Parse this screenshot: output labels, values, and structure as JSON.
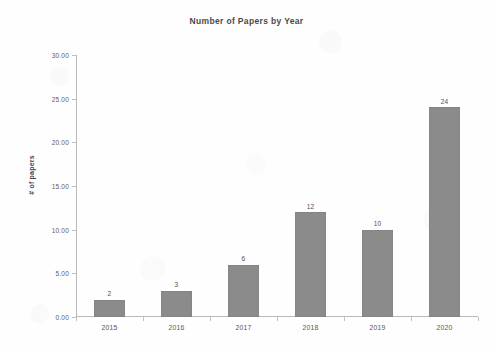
{
  "chart_data": {
    "type": "bar",
    "title": "Number of Papers by Year",
    "xlabel": "",
    "ylabel": "# of papers",
    "categories": [
      "2015",
      "2016",
      "2017",
      "2018",
      "2019",
      "2020"
    ],
    "values": [
      2,
      3,
      6,
      12,
      10,
      24
    ],
    "value_labels": [
      "2",
      "3",
      "6",
      "12",
      "10",
      "24"
    ],
    "ylim": [
      0,
      30
    ],
    "ytick_step": 5,
    "ytick_labels": [
      "0.00",
      "5.00",
      "10.00",
      "15.00",
      "20.00",
      "25.00",
      "30.00"
    ],
    "ytick_values": [
      0,
      5,
      10,
      15,
      20,
      25,
      30
    ],
    "grid": false,
    "legend": false,
    "legend_position": "none",
    "bar_color": "#8b8b8b",
    "axis_color": "#b9b9b9",
    "background_color": "#ffffff"
  }
}
